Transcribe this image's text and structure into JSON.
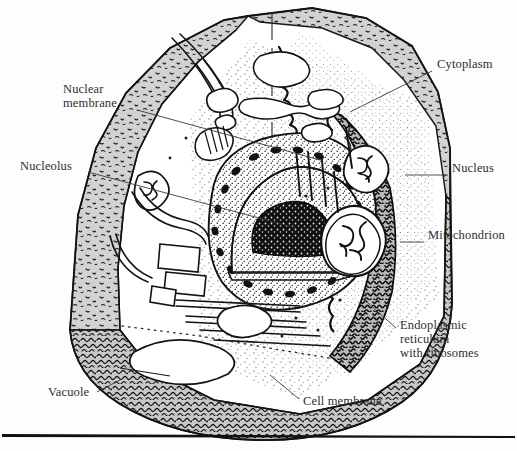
{
  "figure": {
    "background_color": "#fdfdfd",
    "ink_color": "#1a1a1a",
    "label_color": "#2e2e2e",
    "cytoplasm_fill": "#ffffff",
    "wall_fill": "#cfcfcf",
    "membrane_fill": "#bdbdbd",
    "nucleolus_fill": "#141414"
  },
  "labels": [
    {
      "id": "cytoplasm",
      "text": "Cytoplasm",
      "x": 437,
      "y": 64,
      "align": "left",
      "leader": {
        "x1": 432,
        "y1": 71,
        "x2": 350,
        "y2": 112
      }
    },
    {
      "id": "nuclear-membrane",
      "text": "Nuclear\nmembrane",
      "x": 63,
      "y": 88,
      "align": "left",
      "leader": {
        "x1": 137,
        "y1": 110,
        "x2": 320,
        "y2": 160
      }
    },
    {
      "id": "nucleolus",
      "text": "Nucleolus",
      "x": 20,
      "y": 165,
      "align": "left",
      "leader": {
        "x1": 88,
        "y1": 172,
        "x2": 296,
        "y2": 228
      }
    },
    {
      "id": "nucleus",
      "text": "Nucleus",
      "x": 452,
      "y": 168,
      "align": "left",
      "leader": {
        "x1": 448,
        "y1": 175,
        "x2": 405,
        "y2": 175
      }
    },
    {
      "id": "mitochondrion",
      "text": "Mitochondrion",
      "x": 428,
      "y": 235,
      "align": "left",
      "leader": {
        "x1": 424,
        "y1": 242,
        "x2": 404,
        "y2": 242
      }
    },
    {
      "id": "endoplasmic-reticulum",
      "text": "Endoplasmic\nreticulum\nwith ribosomes",
      "x": 400,
      "y": 322,
      "align": "left",
      "leader": {
        "x1": 396,
        "y1": 328,
        "x2": 370,
        "y2": 305
      }
    },
    {
      "id": "vacuole",
      "text": "Vacuole",
      "x": 48,
      "y": 392,
      "align": "left",
      "leader": {
        "x1": 97,
        "y1": 392,
        "x2": 118,
        "y2": 381
      }
    },
    {
      "id": "cell-membrane",
      "text": "Cell membrane",
      "x": 303,
      "y": 401,
      "align": "left",
      "leader": {
        "x1": 299,
        "y1": 400,
        "x2": 272,
        "y2": 377
      }
    }
  ],
  "footer_rule": {
    "y": 435,
    "x1": 2,
    "x2": 515,
    "color": "#111111"
  }
}
